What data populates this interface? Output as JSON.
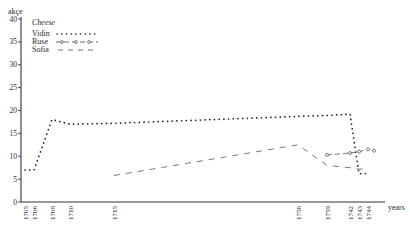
{
  "chart_data": {
    "type": "line",
    "title": "Cheese",
    "xlabel": "years",
    "ylabel": "akçe",
    "ylim": [
      0,
      40
    ],
    "yticks": [
      0,
      5,
      10,
      15,
      20,
      25,
      30,
      35,
      40
    ],
    "x_tick_labels": [
      "1705",
      "1706",
      "1708",
      "1710",
      "1715",
      "1756",
      "1759",
      "1742",
      "1743",
      "1744"
    ],
    "legend_position": "upper-left",
    "grid": false,
    "series": [
      {
        "name": "Vidin",
        "style": "dotted",
        "points": [
          {
            "x": "1705",
            "y": 7
          },
          {
            "x": "1706",
            "y": 7
          },
          {
            "x": "1708",
            "y": 18
          },
          {
            "x": "1710",
            "y": 17
          },
          {
            "x": "1715",
            "y": 17.2
          },
          {
            "x": "1756",
            "y": 18.7
          },
          {
            "x": "1759",
            "y": 18.9
          },
          {
            "x": "1742",
            "y": 19.2
          },
          {
            "x": "1743",
            "y": 6.2
          },
          {
            "x": "1744",
            "y": 6.2
          }
        ]
      },
      {
        "name": "Ruse",
        "style": "dash-circle",
        "points": [
          {
            "x": "1759",
            "y": 10.3
          },
          {
            "x": "1742",
            "y": 10.7
          },
          {
            "x": "1743",
            "y": 11
          },
          {
            "x": "1744",
            "y": 11.5
          }
        ]
      },
      {
        "name": "Sofia",
        "style": "dashed",
        "points": [
          {
            "x": "1715",
            "y": 5.8
          },
          {
            "x": "1756",
            "y": 12.5
          },
          {
            "x": "1759",
            "y": 8
          },
          {
            "x": "1742",
            "y": 7.5
          },
          {
            "x": "1743",
            "y": 7.2
          },
          {
            "x": "1744",
            "y": 7.2
          }
        ]
      }
    ]
  },
  "labels": {
    "y_unit": "akçe",
    "x_unit": "years",
    "legend_title": "Cheese",
    "legend": [
      "Vidin",
      "Ruse",
      "Sofia"
    ]
  }
}
